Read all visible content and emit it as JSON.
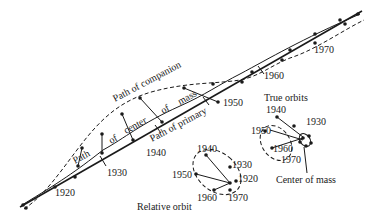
{
  "diagram": {
    "path_labels": {
      "companion": "Path of companion",
      "center_of_mass": [
        "Path",
        "of",
        "center",
        "of",
        "mass"
      ],
      "primary": "Path of primary"
    },
    "path_years": [
      "1920",
      "1930",
      "1940",
      "1950",
      "1960",
      "1970"
    ],
    "true_orbits": {
      "title": "True orbits",
      "years": [
        "1940",
        "1930",
        "1950",
        "1960",
        "1970"
      ],
      "pointer_label": "Center of mass"
    },
    "relative_orbit": {
      "title": "Relative orbit",
      "years": [
        "1940",
        "1930",
        "1920",
        "1950",
        "1960",
        "1970"
      ]
    },
    "colors": {
      "ink": "#1a1a1a",
      "background": "#ffffff"
    }
  }
}
